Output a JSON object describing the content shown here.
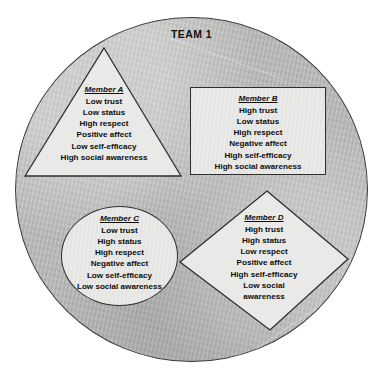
{
  "diagram": {
    "title": "TEAM 1",
    "outer_shape": "circle",
    "colors": {
      "team_circle_fill": "#b8b8b6",
      "member_shape_fill": "#e9e9e7",
      "outline": "#2e2e2e",
      "text": "#0d0d0d",
      "page_background": "#ffffff"
    },
    "members": [
      {
        "id": "a",
        "heading": "Member A",
        "shape": "triangle",
        "attributes": [
          "Low trust",
          "Low status",
          "High respect",
          "Positive affect",
          "Low self-efficacy",
          "High social awareness"
        ]
      },
      {
        "id": "b",
        "heading": "Member B",
        "shape": "rectangle",
        "attributes": [
          "High trust",
          "Low status",
          "High respect",
          "Negative affect",
          "High self-efficacy",
          "High social awareness"
        ]
      },
      {
        "id": "c",
        "heading": "Member C",
        "shape": "circle",
        "attributes": [
          "Low trust",
          "High status",
          "High respect",
          "Negative affect",
          "Low self-efficacy",
          "Low social awareness"
        ]
      },
      {
        "id": "d",
        "heading": "Member D",
        "shape": "diamond",
        "attributes": [
          "High trust",
          "High status",
          "Low respect",
          "Positive affect",
          "High self-efficacy",
          "Low social",
          "awareness"
        ]
      }
    ]
  }
}
